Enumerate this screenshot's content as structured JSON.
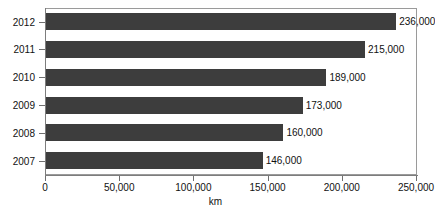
{
  "chart_data": {
    "type": "bar",
    "orientation": "horizontal",
    "title": "",
    "xlabel": "km",
    "ylabel": "",
    "categories": [
      "2012",
      "2011",
      "2010",
      "2009",
      "2008",
      "2007"
    ],
    "values": [
      236000,
      215000,
      189000,
      173000,
      160000,
      146000
    ],
    "data_labels": [
      "236,000",
      "215,000",
      "189,000",
      "173,000",
      "160,000",
      "146,000"
    ],
    "xlim": [
      0,
      250000
    ],
    "x_ticks": [
      0,
      50000,
      100000,
      150000,
      200000,
      250000
    ],
    "x_tick_labels": [
      "0",
      "50,000",
      "100,000",
      "150,000",
      "200,000",
      "250,000"
    ],
    "grid": false,
    "legend": null,
    "series": [
      {
        "name": "km",
        "values": [
          236000,
          215000,
          189000,
          173000,
          160000,
          146000
        ]
      }
    ],
    "colors": {
      "bar": "#3d3d3d",
      "frame": "#9a9a9a",
      "axis": "#7d7d7d",
      "text": "#111111",
      "background": "#ffffff"
    }
  }
}
